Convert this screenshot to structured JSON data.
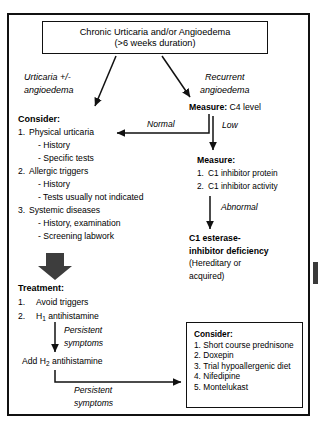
{
  "diagram": {
    "title_box": {
      "line1": "Chronic Urticaria and/or Angioedema",
      "line2": "(>6 weeks duration)"
    },
    "branch_labels": {
      "left_line1": "Urticaria +/-",
      "left_line2": "angioedema",
      "right_line1": "Recurrent",
      "right_line2": "angioedema"
    },
    "left_branch": {
      "heading": "Consider:",
      "items": [
        {
          "num": "1.",
          "text": "Physical urticaria"
        },
        {
          "sub": "- History"
        },
        {
          "sub": "- Specific tests"
        },
        {
          "num": "2.",
          "text": "Allergic triggers"
        },
        {
          "sub": "- History"
        },
        {
          "sub": "- Tests usually not indicated"
        },
        {
          "num": "3.",
          "text": "Systemic diseases"
        },
        {
          "sub": "- History, examination"
        },
        {
          "sub": "- Screening labwork"
        }
      ]
    },
    "treatment": {
      "heading": "Treatment:",
      "items": [
        {
          "num": "1.",
          "text": "Avoid triggers"
        },
        {
          "num": "2.",
          "text": "H",
          "sub": "1",
          "text2": " antihistamine"
        }
      ],
      "step2": "Add H",
      "step2_sub": "2",
      "step2_tail": " antihistamine"
    },
    "right_branch": {
      "measure_c4_label": "Measure:",
      "measure_c4_value": " C4 level",
      "measure2_heading": "Measure:",
      "measure2_items": [
        {
          "num": "1.",
          "text": "C1 inhibitor protein"
        },
        {
          "num": "2.",
          "text": "C1 inhibitor activity"
        }
      ],
      "deficiency_line1": "C1 esterase-",
      "deficiency_line2": "inhibitor deficiency",
      "deficiency_line3": "(Hereditary or",
      "deficiency_line4": "acquired)"
    },
    "arrow_labels": {
      "normal": "Normal",
      "low": "Low",
      "abnormal": "Abnormal",
      "persistent1_l1": "Persistent",
      "persistent1_l2": "symptoms",
      "persistent2_l1": "Persistent",
      "persistent2_l2": "symptoms"
    },
    "consider_box": {
      "heading": "Consider:",
      "items": [
        {
          "num": "1.",
          "text": "Short course prednisone"
        },
        {
          "num": "2.",
          "text": "Doxepin"
        },
        {
          "num": "3.",
          "text": "Trial hypoallergenic diet"
        },
        {
          "num": "4.",
          "text": "Nifedipine"
        },
        {
          "num": "5.",
          "text": "Montelukast"
        }
      ]
    },
    "colors": {
      "ink": "#111111",
      "background": "#ffffff",
      "thick_arrow": "#3d3d3d"
    }
  }
}
